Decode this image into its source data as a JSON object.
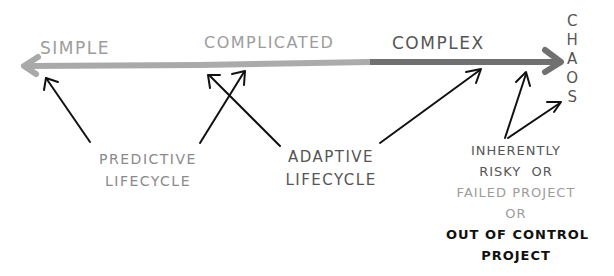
{
  "diagram": {
    "spectrum": {
      "zones": [
        {
          "label": "SIMPLE",
          "color": "#a8a8a8"
        },
        {
          "label": "COMPLICATED",
          "color": "#ababab"
        },
        {
          "label": "COMPLEX",
          "color": "#707070"
        }
      ],
      "end_label_letters": [
        "C",
        "H",
        "A",
        "O",
        "S"
      ]
    },
    "annotations": {
      "predictive": {
        "line1": "PREDICTIVE",
        "line2": "LIFECYCLE"
      },
      "adaptive": {
        "line1": "ADAPTIVE",
        "line2": "LIFECYCLE"
      },
      "chaos_note": {
        "line1": "INHERENTLY",
        "line2": "RISKY  OR",
        "line3": "FAILED PROJECT",
        "line4": "OR",
        "line5": "OUT OF CONTROL",
        "line6": "PROJECT"
      }
    },
    "colors": {
      "arrow_light": "#a8a8a8",
      "arrow_dark": "#707070",
      "pointer": "#111111"
    }
  }
}
